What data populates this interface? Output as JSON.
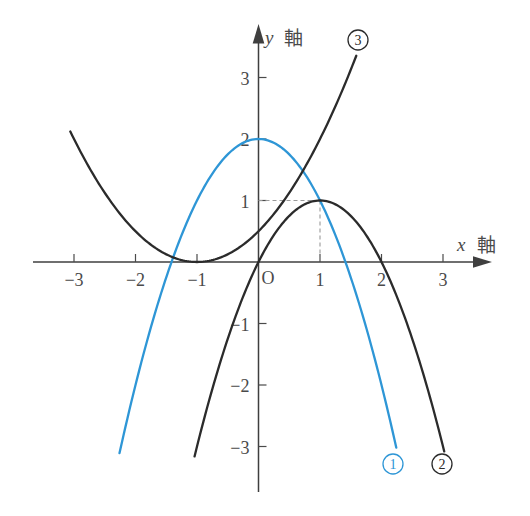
{
  "figure": {
    "background": "#ffffff"
  },
  "axes": {
    "x": {
      "label_variable": "x",
      "label_word": "軸",
      "tick_values": [
        -3,
        -2,
        -1,
        1,
        2,
        3
      ],
      "tick_labels": [
        "−3",
        "−2",
        "−1",
        "1",
        "2",
        "3"
      ]
    },
    "y": {
      "label_variable": "y",
      "label_word": "軸",
      "tick_values": [
        3,
        2,
        1,
        -1,
        -2,
        -3
      ],
      "tick_labels": [
        "3",
        "2",
        "1",
        "−1",
        "−2",
        "−3"
      ]
    },
    "origin_label": "O"
  },
  "chart_data": {
    "type": "line",
    "grid": false,
    "legend_position": "none",
    "coordinate_system": {
      "origin_px": [
        258.5,
        262
      ],
      "unit_px": 61.5,
      "x_range": [
        -3.6,
        3.7
      ],
      "y_range": [
        -3.7,
        3.8
      ]
    },
    "series": [
      {
        "id": "curve-1",
        "badge": "1",
        "shape": "parabola",
        "vertex": [
          0,
          2
        ],
        "a": -1,
        "x_domain": [
          -2.26,
          2.24
        ],
        "x_intercepts": [
          -1.41,
          1.41
        ],
        "y_intercept": 2,
        "color": "#2e96d6",
        "badge_center_px": [
          393,
          464
        ]
      },
      {
        "id": "curve-2",
        "badge": "2",
        "shape": "parabola",
        "vertex": [
          1,
          1
        ],
        "a": -1,
        "x_domain": [
          -1.04,
          3.02
        ],
        "x_intercepts": [
          0,
          2
        ],
        "y_intercept": 0,
        "color": "#2b2b2b",
        "badge_center_px": [
          442,
          464
        ]
      },
      {
        "id": "curve-3",
        "badge": "3",
        "shape": "parabola",
        "vertex": [
          -1,
          0
        ],
        "a": 0.5,
        "x_domain": [
          -3.06,
          1.59
        ],
        "x_intercepts": [
          -1
        ],
        "y_intercept": 0.5,
        "color": "#2b2b2b",
        "badge_center_px": [
          358,
          40
        ]
      }
    ],
    "guides": [
      {
        "from": [
          0,
          1
        ],
        "to": [
          1,
          1
        ]
      },
      {
        "from": [
          1,
          1
        ],
        "to": [
          1,
          0
        ]
      }
    ],
    "marked_point": [
      1,
      1
    ]
  },
  "style": {
    "axis_color": "#3f3f3f",
    "text_color": "#4a4a4a",
    "guide_color": "#9a9a9a"
  }
}
